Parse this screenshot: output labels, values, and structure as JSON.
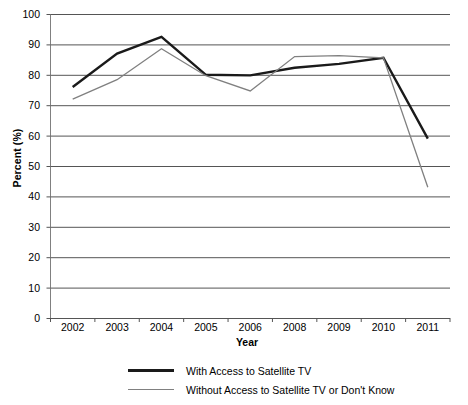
{
  "chart_data": {
    "type": "line",
    "title": "",
    "xlabel": "Year",
    "ylabel": "Percent (%)",
    "categories": [
      "2002",
      "2003",
      "2004",
      "2005",
      "2006",
      "2008",
      "2009",
      "2010",
      "2011"
    ],
    "ylim": [
      0,
      100
    ],
    "yticks": [
      "0",
      "10",
      "20",
      "30",
      "40",
      "50",
      "60",
      "70",
      "80",
      "90",
      "100"
    ],
    "ytick_values": [
      0,
      10,
      20,
      30,
      40,
      50,
      60,
      70,
      80,
      90,
      100
    ],
    "grid": true,
    "grid_axis": "y",
    "legend_position": "bottom",
    "series": [
      {
        "name": "With Access to Satellite TV",
        "color": "#1a1a1a",
        "width": 2.4,
        "values": [
          76,
          87,
          92.5,
          80,
          79.8,
          82.3,
          83.6,
          85.6,
          59
        ]
      },
      {
        "name": "Without Access to Satellite TV or Don't Know",
        "color": "#808080",
        "width": 1.3,
        "values": [
          72,
          78.4,
          88.6,
          79.7,
          74.7,
          86,
          86.3,
          85.6,
          43
        ]
      }
    ]
  },
  "axis": {
    "y_title": "Percent (%)",
    "x_title": "Year"
  }
}
